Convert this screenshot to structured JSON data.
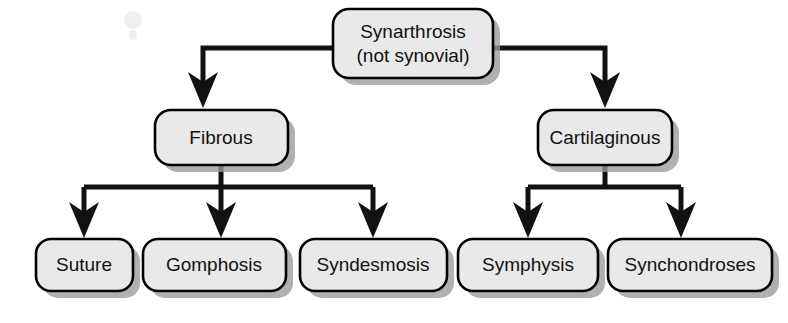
{
  "diagram": {
    "type": "hierarchy-tree",
    "background_color": "#ffffff",
    "box_fill_color": "#e9e9e9",
    "box_border_color": "#000000",
    "connector_color": "#111111",
    "shadow_color": "#9a9a9a",
    "levels": 3
  },
  "nodes": {
    "root": {
      "id": "synarthrosis",
      "line1": "Synarthrosis",
      "line2": "(not synovial)",
      "level": 0,
      "x": 333,
      "y": 9,
      "width": 160,
      "height": 69
    },
    "branch_fibrous": {
      "id": "fibrous",
      "label": "Fibrous",
      "level": 1,
      "x": 155,
      "y": 110,
      "width": 133,
      "height": 55
    },
    "branch_cartilaginous": {
      "id": "cartilaginous",
      "label": "Cartilaginous",
      "level": 1,
      "x": 538,
      "y": 110,
      "width": 134,
      "height": 55
    },
    "leaves": [
      {
        "id": "suture",
        "label": "Suture",
        "parent": "fibrous",
        "level": 2,
        "x": 36,
        "y": 239,
        "width": 97,
        "height": 52
      },
      {
        "id": "gomphosis",
        "label": "Gomphosis",
        "parent": "fibrous",
        "level": 2,
        "x": 143,
        "y": 239,
        "width": 143,
        "height": 52
      },
      {
        "id": "syndesmosis",
        "label": "Syndesmosis",
        "parent": "fibrous",
        "level": 2,
        "x": 300,
        "y": 239,
        "width": 147,
        "height": 52
      },
      {
        "id": "symphysis",
        "label": "Symphysis",
        "parent": "cartilaginous",
        "level": 2,
        "x": 458,
        "y": 239,
        "width": 140,
        "height": 52
      },
      {
        "id": "synchondroses",
        "label": "Synchondroses",
        "parent": "cartilaginous",
        "level": 2,
        "x": 608,
        "y": 239,
        "width": 164,
        "height": 52
      }
    ]
  },
  "edges": [
    {
      "id": "root-to-fibrous",
      "from": "synarthrosis",
      "to": "fibrous",
      "style": "elbow-left-down",
      "arrow": true
    },
    {
      "id": "root-to-cartilaginous",
      "from": "synarthrosis",
      "to": "cartilaginous",
      "style": "elbow-right-down",
      "arrow": true
    },
    {
      "id": "fibrous-to-suture",
      "from": "fibrous",
      "to": "suture",
      "style": "tee-down",
      "arrow": true
    },
    {
      "id": "fibrous-to-gomphosis",
      "from": "fibrous",
      "to": "gomphosis",
      "style": "tee-down",
      "arrow": true
    },
    {
      "id": "fibrous-to-syndesmosis",
      "from": "fibrous",
      "to": "syndesmosis",
      "style": "tee-down",
      "arrow": true
    },
    {
      "id": "cartilaginous-to-symphysis",
      "from": "cartilaginous",
      "to": "symphysis",
      "style": "tee-down",
      "arrow": true
    },
    {
      "id": "cartilaginous-to-synchondroses",
      "from": "cartilaginous",
      "to": "synchondroses",
      "style": "tee-down",
      "arrow": true
    }
  ]
}
